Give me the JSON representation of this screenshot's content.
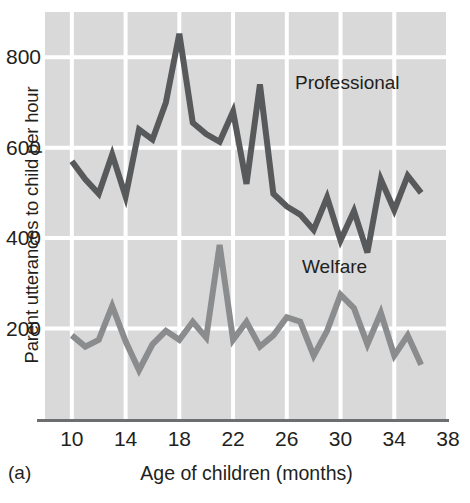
{
  "panel": {
    "id_label": "(a)"
  },
  "chart_data": {
    "type": "line",
    "title": "",
    "xlabel": "Age of children (months)",
    "ylabel": "Parent utterances to child per hour",
    "xlim": [
      8,
      38
    ],
    "ylim": [
      0,
      900
    ],
    "xticks": [
      10,
      14,
      18,
      22,
      26,
      30,
      34,
      38
    ],
    "xtick_labels": [
      "10",
      "14",
      "18",
      "22",
      "26",
      "30",
      "34",
      "38"
    ],
    "yticks": [
      200,
      400,
      600,
      800
    ],
    "ytick_labels": [
      "200",
      "400",
      "600",
      "800"
    ],
    "grid": true,
    "grid_color": "#ffffff",
    "plot_background": "#d9d9d9",
    "legend_position": "inline-annotation",
    "series": [
      {
        "name": "Professional",
        "color": "#58595b",
        "label_x": 27.5,
        "label_y": 680,
        "x": [
          10,
          11,
          12,
          13,
          14,
          15,
          16,
          17,
          18,
          19,
          20,
          21,
          22,
          23,
          24,
          25,
          26,
          27,
          28,
          29,
          30,
          31,
          32,
          33,
          34,
          35,
          36
        ],
        "values": [
          570,
          530,
          498,
          585,
          492,
          640,
          618,
          700,
          852,
          655,
          630,
          613,
          680,
          520,
          740,
          498,
          470,
          452,
          418,
          490,
          395,
          460,
          368,
          530,
          462,
          538,
          500
        ]
      },
      {
        "name": "Welfare",
        "color": "#8b8c8e",
        "label_x": 27.7,
        "label_y": 300,
        "x": [
          10,
          11,
          12,
          13,
          14,
          15,
          16,
          17,
          18,
          19,
          20,
          21,
          22,
          23,
          24,
          25,
          26,
          27,
          28,
          29,
          30,
          31,
          32,
          33,
          34,
          35,
          36
        ],
        "values": [
          185,
          160,
          175,
          250,
          172,
          108,
          165,
          195,
          175,
          215,
          180,
          385,
          175,
          215,
          160,
          185,
          225,
          215,
          140,
          195,
          275,
          245,
          165,
          235,
          140,
          185,
          120
        ]
      }
    ]
  }
}
